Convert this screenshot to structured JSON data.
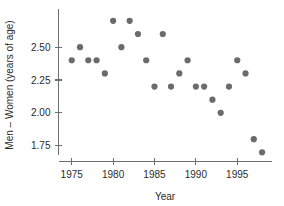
{
  "chart_data": {
    "type": "scatter",
    "title": "",
    "subtitle": "",
    "xlabel": "Year",
    "ylabel": "Men – Women (years of age)",
    "x": [
      1975,
      1976,
      1977,
      1978,
      1979,
      1980,
      1981,
      1982,
      1983,
      1984,
      1985,
      1986,
      1987,
      1988,
      1989,
      1990,
      1991,
      1992,
      1993,
      1994,
      1995,
      1996,
      1997,
      1998
    ],
    "values": [
      2.4,
      2.5,
      2.4,
      2.4,
      2.3,
      2.7,
      2.5,
      2.7,
      2.6,
      2.4,
      2.2,
      2.6,
      2.2,
      2.3,
      2.4,
      2.2,
      2.2,
      2.1,
      2.0,
      2.2,
      2.4,
      2.3,
      1.8,
      1.7
    ],
    "series": [
      {
        "name": "Men – Women life expectancy gap",
        "values": [
          2.4,
          2.5,
          2.4,
          2.4,
          2.3,
          2.7,
          2.5,
          2.7,
          2.6,
          2.4,
          2.2,
          2.6,
          2.2,
          2.3,
          2.4,
          2.2,
          2.2,
          2.1,
          2.0,
          2.2,
          2.4,
          2.3,
          1.8,
          1.7
        ]
      }
    ],
    "xticks": [
      1975,
      1980,
      1985,
      1990,
      1995
    ],
    "xticklabels": [
      "1975",
      "1980",
      "1985",
      "1990",
      "1995"
    ],
    "yticks": [
      1.75,
      2.0,
      2.25,
      2.5
    ],
    "yticklabels": [
      "1.75",
      "2.00",
      "2.25",
      "2.50"
    ],
    "xlim": [
      1973.4,
      1999.2
    ],
    "ylim": [
      1.63,
      2.79
    ],
    "grid": false,
    "legend": false,
    "legend_position": "none",
    "marker": "circle",
    "marker_color": "#6b6b6b",
    "marker_size": 3.1,
    "axis_color": "#6e6e6e",
    "background_color": "#ffffff",
    "annotations": []
  }
}
